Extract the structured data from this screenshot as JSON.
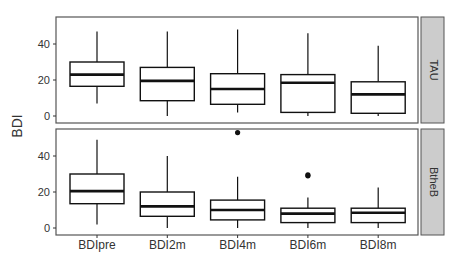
{
  "chart_data": {
    "type": "boxplot",
    "title": "",
    "xlabel": "",
    "ylabel": "BDI",
    "categories": [
      "BDIpre",
      "BDI2m",
      "BDI4m",
      "BDI6m",
      "BDI8m"
    ],
    "ylim": [
      -2,
      55
    ],
    "yticks": [
      0,
      20,
      40
    ],
    "grid": false,
    "facets": [
      {
        "name": "TAU",
        "boxes": [
          {
            "category": "BDIpre",
            "min": 7,
            "q1": 16.5,
            "median": 23,
            "q3": 30,
            "max": 47,
            "outliers": []
          },
          {
            "category": "BDI2m",
            "min": 0,
            "q1": 8.5,
            "median": 19.5,
            "q3": 27,
            "max": 47,
            "outliers": []
          },
          {
            "category": "BDI4m",
            "min": 2,
            "q1": 6.5,
            "median": 15,
            "q3": 23.5,
            "max": 48,
            "outliers": []
          },
          {
            "category": "BDI6m",
            "min": 0,
            "q1": 2,
            "median": 18.5,
            "q3": 23,
            "max": 46,
            "outliers": []
          },
          {
            "category": "BDI8m",
            "min": 0,
            "q1": 1.5,
            "median": 12,
            "q3": 19,
            "max": 39,
            "outliers": []
          }
        ]
      },
      {
        "name": "BtheB",
        "boxes": [
          {
            "category": "BDIpre",
            "min": 2,
            "q1": 13.5,
            "median": 20.5,
            "q3": 30,
            "max": 49,
            "outliers": []
          },
          {
            "category": "BDI2m",
            "min": 0,
            "q1": 6.5,
            "median": 12,
            "q3": 20,
            "max": 40,
            "outliers": []
          },
          {
            "category": "BDI4m",
            "min": 0,
            "q1": 4.5,
            "median": 10,
            "q3": 15.5,
            "max": 28.5,
            "outliers": [
              53
            ]
          },
          {
            "category": "BDI6m",
            "min": 0,
            "q1": 3,
            "median": 8,
            "q3": 11,
            "max": 17,
            "outliers": [
              29,
              29.5
            ]
          },
          {
            "category": "BDI8m",
            "min": 0,
            "q1": 3,
            "median": 8.5,
            "q3": 11,
            "max": 22.5,
            "outliers": []
          }
        ]
      }
    ],
    "legend": null
  },
  "colors": {
    "panel_border": "#555555",
    "strip_fill": "#cccccc",
    "box_stroke": "#111111",
    "text": "#333333"
  }
}
